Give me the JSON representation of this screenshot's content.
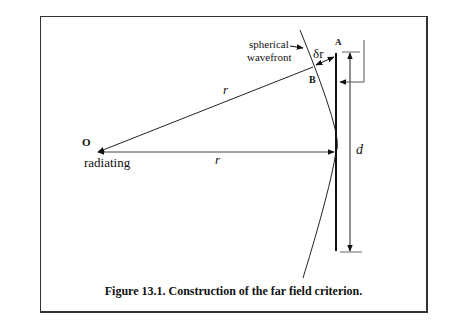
{
  "figure": {
    "caption": "Figure 13.1. Construction of the far field criterion.",
    "labels": {
      "origin": "O",
      "source": "radiating",
      "upper_r": "r",
      "lower_r": "r",
      "wavefront_line1": "spherical",
      "wavefront_line2": "wavefront",
      "delta_r": "δr",
      "point_a": "A",
      "point_b": "B",
      "aperture": "d"
    },
    "colors": {
      "line": "#111111",
      "frame": "#333333",
      "background": "#ffffff"
    }
  }
}
